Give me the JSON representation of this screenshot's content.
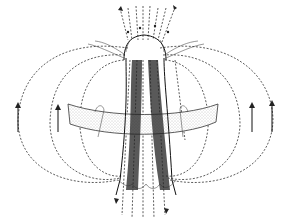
{
  "diagram": {
    "colors": {
      "background": "#ffffff",
      "ink": "#111111",
      "dotted_fill": "#e6e6e6"
    },
    "labels": []
  }
}
